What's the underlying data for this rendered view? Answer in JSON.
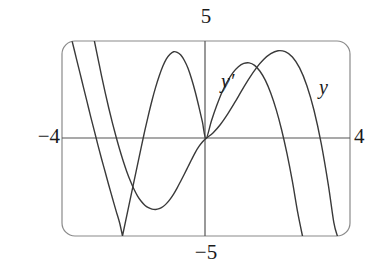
{
  "figure": {
    "kind": "graphing-calculator-viewport",
    "window": {
      "xmin_label": "−4",
      "xmax_label": "4",
      "ymin_label": "−5",
      "ymax_label": "5"
    },
    "curve_labels": {
      "derivative": "y′",
      "function": "y"
    },
    "colors": {
      "curve": "#3a3a3a",
      "axis": "#555555",
      "frame": "#8a8a8a",
      "text": "#1b1b1b",
      "background": "#ffffff"
    }
  },
  "chart_data": {
    "type": "line",
    "title": "",
    "xlabel": "",
    "ylabel": "",
    "xlim": [
      -4,
      4
    ],
    "ylim": [
      -5,
      5
    ],
    "grid": false,
    "axes": "centered-crosshair",
    "legend": "inline-curve-labels",
    "annotations": [
      {
        "text": "5",
        "position": "top-center-outside",
        "meaning": "ymax"
      },
      {
        "text": "−5",
        "position": "bottom-center-outside",
        "meaning": "ymin"
      },
      {
        "text": "−4",
        "position": "left-middle-outside",
        "meaning": "xmin"
      },
      {
        "text": "4",
        "position": "right-middle-outside",
        "meaning": "xmax"
      },
      {
        "text": "y′",
        "position": "inside-upper-left-of-first-peak",
        "meaning": "derivative curve label"
      },
      {
        "text": "y",
        "position": "inside-upper-right",
        "meaning": "function curve label"
      }
    ],
    "series": [
      {
        "name": "y",
        "label": "y",
        "points": [
          [
            -3.1,
            5.0
          ],
          [
            -3.0,
            4.1
          ],
          [
            -2.9,
            3.2
          ],
          [
            -2.8,
            2.35
          ],
          [
            -2.7,
            1.55
          ],
          [
            -2.6,
            0.8
          ],
          [
            -2.5,
            0.1
          ],
          [
            -2.4,
            -0.55
          ],
          [
            -2.3,
            -1.15
          ],
          [
            -2.2,
            -1.7
          ],
          [
            -2.1,
            -2.18
          ],
          [
            -2.0,
            -2.6
          ],
          [
            -1.9,
            -2.95
          ],
          [
            -1.8,
            -3.22
          ],
          [
            -1.7,
            -3.42
          ],
          [
            -1.6,
            -3.55
          ],
          [
            -1.5,
            -3.62
          ],
          [
            -1.4,
            -3.64
          ],
          [
            -1.3,
            -3.6
          ],
          [
            -1.2,
            -3.5
          ],
          [
            -1.1,
            -3.34
          ],
          [
            -1.0,
            -3.12
          ],
          [
            -0.9,
            -2.85
          ],
          [
            -0.8,
            -2.53
          ],
          [
            -0.7,
            -2.18
          ],
          [
            -0.6,
            -1.82
          ],
          [
            -0.5,
            -1.45
          ],
          [
            -0.4,
            -1.08
          ],
          [
            -0.3,
            -0.72
          ],
          [
            -0.2,
            -0.42
          ],
          [
            -0.1,
            -0.18
          ],
          [
            0.0,
            0.0
          ],
          [
            0.2,
            0.3
          ],
          [
            0.4,
            0.72
          ],
          [
            0.6,
            1.25
          ],
          [
            0.8,
            1.85
          ],
          [
            1.0,
            2.48
          ],
          [
            1.2,
            3.08
          ],
          [
            1.4,
            3.62
          ],
          [
            1.6,
            4.05
          ],
          [
            1.8,
            4.35
          ],
          [
            2.0,
            4.5
          ],
          [
            2.2,
            4.45
          ],
          [
            2.4,
            4.18
          ],
          [
            2.6,
            3.62
          ],
          [
            2.8,
            2.72
          ],
          [
            3.0,
            1.45
          ],
          [
            3.2,
            -0.25
          ],
          [
            3.4,
            -2.4
          ],
          [
            3.55,
            -4.3
          ],
          [
            3.65,
            -5.0
          ]
        ]
      },
      {
        "name": "y'",
        "label": "y′",
        "points": [
          [
            -3.72,
            5.0
          ],
          [
            -3.6,
            4.1
          ],
          [
            -3.5,
            3.35
          ],
          [
            -3.4,
            2.6
          ],
          [
            -3.3,
            1.85
          ],
          [
            -3.2,
            1.1
          ],
          [
            -3.1,
            0.38
          ],
          [
            -3.0,
            -0.35
          ],
          [
            -2.9,
            -1.05
          ],
          [
            -2.8,
            -1.72
          ],
          [
            -2.7,
            -2.4
          ],
          [
            -2.6,
            -3.05
          ],
          [
            -2.5,
            -3.7
          ],
          [
            -2.4,
            -4.32
          ],
          [
            -2.32,
            -5.0
          ],
          [
            -2.32,
            -5.0
          ],
          [
            -2.0,
            -2.2
          ],
          [
            -1.8,
            -0.45
          ],
          [
            -1.7,
            0.4
          ],
          [
            -1.6,
            1.2
          ],
          [
            -1.5,
            1.95
          ],
          [
            -1.4,
            2.62
          ],
          [
            -1.3,
            3.2
          ],
          [
            -1.2,
            3.7
          ],
          [
            -1.1,
            4.08
          ],
          [
            -1.0,
            4.32
          ],
          [
            -0.9,
            4.45
          ],
          [
            -0.8,
            4.42
          ],
          [
            -0.7,
            4.28
          ],
          [
            -0.6,
            4.0
          ],
          [
            -0.5,
            3.6
          ],
          [
            -0.4,
            3.05
          ],
          [
            -0.3,
            2.4
          ],
          [
            -0.2,
            1.65
          ],
          [
            -0.1,
            0.85
          ],
          [
            0.0,
            0.0
          ],
          [
            0.15,
            0.9
          ],
          [
            0.3,
            1.7
          ],
          [
            0.45,
            2.4
          ],
          [
            0.6,
            2.95
          ],
          [
            0.75,
            3.38
          ],
          [
            0.9,
            3.68
          ],
          [
            1.05,
            3.85
          ],
          [
            1.2,
            3.88
          ],
          [
            1.35,
            3.75
          ],
          [
            1.5,
            3.45
          ],
          [
            1.65,
            2.98
          ],
          [
            1.8,
            2.32
          ],
          [
            1.95,
            1.48
          ],
          [
            2.1,
            0.45
          ],
          [
            2.25,
            -0.78
          ],
          [
            2.4,
            -2.2
          ],
          [
            2.55,
            -3.82
          ],
          [
            2.68,
            -5.0
          ]
        ]
      }
    ]
  }
}
